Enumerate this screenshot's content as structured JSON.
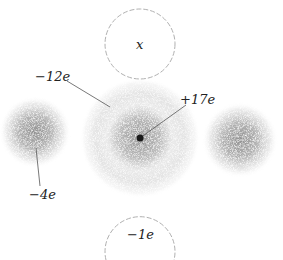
{
  "diagram": {
    "colors": {
      "cloud": "#9a9a9a",
      "dashed_circle": "#b0b0b0",
      "leader_line": "#555555",
      "nucleus": "#1a1a1a",
      "text": "#222222"
    },
    "nodes": [
      {
        "id": "top-circle",
        "type": "dashed-circle",
        "label": "x"
      },
      {
        "id": "central-cloud",
        "type": "charge-cloud",
        "label": "−12e"
      },
      {
        "id": "nucleus",
        "type": "point",
        "label": "+17e"
      },
      {
        "id": "left-cloud",
        "type": "charge-cloud",
        "label": "−4e"
      },
      {
        "id": "right-cloud",
        "type": "charge-cloud",
        "label": ""
      },
      {
        "id": "bottom-circle",
        "type": "dashed-circle",
        "label": "−1e"
      }
    ],
    "labels": {
      "top_circle": "x",
      "outer_shell": "−12e",
      "nucleus": "+17e",
      "left_cloud": "−4e",
      "bottom_circle": "−1e"
    }
  }
}
